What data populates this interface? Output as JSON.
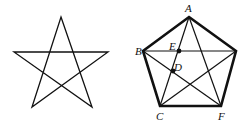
{
  "figures": [
    {
      "id": "star",
      "description": "Five-pointed star (pentagram)",
      "points": {
        "top": [
          61,
          17
        ],
        "left": [
          14,
          52
        ],
        "right": [
          108,
          52
        ],
        "bottom_left": [
          32,
          107
        ],
        "bottom_right": [
          92,
          107
        ]
      }
    },
    {
      "id": "pentagon",
      "description": "Regular pentagon with all diagonals drawn",
      "labels": {
        "A": "A",
        "B": "B",
        "C": "C",
        "D": "D",
        "E": "E",
        "F": "F"
      },
      "points": {
        "A": [
          189,
          17
        ],
        "B": [
          143,
          51
        ],
        "R": [
          236,
          51
        ],
        "C": [
          160,
          106
        ],
        "F": [
          221,
          106
        ],
        "E": [
          179,
          51
        ],
        "D": [
          173,
          71
        ]
      }
    }
  ],
  "colors": {
    "stroke": "#111111",
    "background": "#ffffff"
  }
}
